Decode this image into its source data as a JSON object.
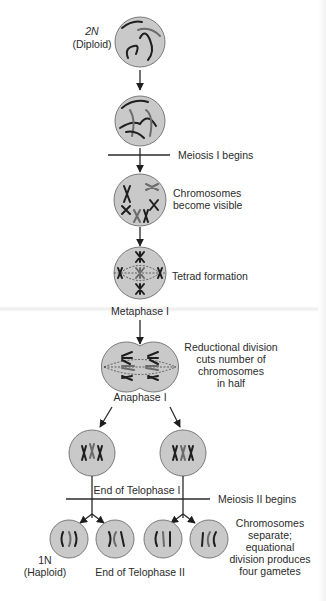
{
  "figure": {
    "colors": {
      "cell_fill": "#c9c9c9",
      "ink": "#2b2b2b",
      "chromosome_dark": "#1e1e1e",
      "chromosome_light": "#6b6b6b"
    }
  },
  "stages": {
    "diploid": {
      "ploidy": "2N",
      "note": "(Diploid)"
    },
    "meiosis1_begins": "Meiosis I begins",
    "chromosomes_visible": {
      "line1": "Chromosomes",
      "line2": "become visible"
    },
    "tetrad": "Tetrad formation",
    "metaphase1": "Metaphase I",
    "reductional": {
      "line1": "Reductional division",
      "line2": "cuts number of",
      "line3": "chromosomes",
      "line4": "in half"
    },
    "anaphase1": "Anaphase I",
    "telophase1_end": "End of Telophase I",
    "meiosis2_begins": "Meiosis II begins",
    "haploid": {
      "ploidy": "1N",
      "note": "(Haploid)"
    },
    "telophase2_end": "End of Telophase II",
    "equational": {
      "line1": "Chromosomes",
      "line2": "separate;",
      "line3": "equational",
      "line4": "division produces",
      "line5": "four gametes"
    }
  }
}
